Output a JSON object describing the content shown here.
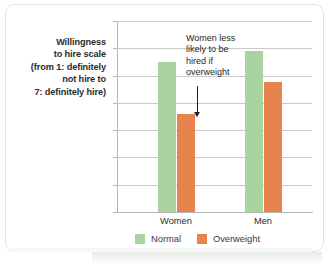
{
  "axis_caption": {
    "line1": "Willingness",
    "line2": "to hire scale",
    "line3": "(from 1: definitely",
    "line4": "not hire to",
    "line5": "7: definitely hire)"
  },
  "annotation": {
    "text": "Women less likely to be hired if overweight"
  },
  "legend": {
    "items": [
      {
        "label": "Normal",
        "color": "#a9d4a1"
      },
      {
        "label": "Overweight",
        "color": "#e8834e"
      }
    ]
  },
  "chart_data": {
    "type": "bar",
    "title": "",
    "xlabel": "",
    "ylabel": "Willingness to hire scale (from 1: definitely not hire to 7: definitely hire)",
    "categories": [
      "Women",
      "Men"
    ],
    "series": [
      {
        "name": "Normal",
        "color": "#a9d4a1",
        "values": [
          5.5,
          5.9
        ]
      },
      {
        "name": "Overweight",
        "color": "#e8834e",
        "values": [
          3.6,
          4.75
        ]
      }
    ],
    "ylim": [
      0,
      7
    ],
    "yticks": [
      0,
      1,
      2,
      3,
      4,
      5,
      6,
      7
    ],
    "ytick_labels": [
      "0",
      "1",
      "2",
      "3",
      "4",
      "5",
      "6",
      "7"
    ],
    "grid": true,
    "legend_position": "bottom",
    "annotations": [
      {
        "text": "Women less likely to be hired if overweight",
        "points_to": "Women / Overweight bar"
      }
    ]
  }
}
